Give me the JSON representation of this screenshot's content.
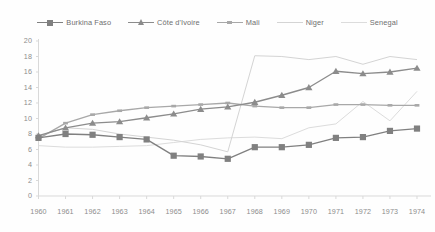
{
  "chart_data": {
    "type": "line",
    "title": "",
    "xlabel": "",
    "ylabel": "",
    "grid": false,
    "legend_position": "top",
    "ylim": [
      0,
      20
    ],
    "ytick_labels": [
      "20",
      "18",
      "16",
      "14",
      "12",
      "10",
      "8",
      "6",
      "4",
      "2",
      "0"
    ],
    "yticks": [
      20,
      18,
      16,
      14,
      12,
      10,
      8,
      6,
      4,
      2,
      0
    ],
    "categories": [
      "1960",
      "1961",
      "1962",
      "1963",
      "1964",
      "1965",
      "1966",
      "1967",
      "1968",
      "1969",
      "1970",
      "1971",
      "1972",
      "1973",
      "1974"
    ],
    "x": [
      1960,
      1961,
      1962,
      1963,
      1964,
      1965,
      1966,
      1967,
      1968,
      1969,
      1970,
      1971,
      1972,
      1973,
      1974
    ],
    "series": [
      {
        "name": "Burkina Faso",
        "color": "#808080",
        "marker": "square",
        "values": [
          7.5,
          8.0,
          7.9,
          7.6,
          7.3,
          5.2,
          5.1,
          4.8,
          6.3,
          6.3,
          6.6,
          7.5,
          7.6,
          8.4,
          8.7
        ]
      },
      {
        "name": "Côte d'Ivoire",
        "color": "#8c8c8c",
        "marker": "triangle",
        "values": [
          7.8,
          8.8,
          9.4,
          9.6,
          10.1,
          10.6,
          11.2,
          11.5,
          12.1,
          13.0,
          14.0,
          16.1,
          15.8,
          16.0,
          16.5
        ]
      },
      {
        "name": "Mali",
        "color": "#a8a8a8",
        "marker": "tick",
        "values": [
          7.4,
          9.4,
          10.5,
          11.0,
          11.4,
          11.6,
          11.8,
          12.0,
          11.6,
          11.4,
          11.4,
          11.8,
          11.8,
          11.7,
          11.7
        ]
      },
      {
        "name": "Niger",
        "color": "#d4d4d4",
        "marker": "none",
        "values": [
          7.7,
          8.8,
          8.6,
          8.0,
          7.6,
          7.2,
          6.6,
          5.7,
          18.1,
          18.0,
          17.6,
          18.0,
          17.0,
          18.0,
          17.6
        ]
      },
      {
        "name": "Senegal",
        "color": "#dcdcdc",
        "marker": "none",
        "values": [
          6.5,
          6.3,
          6.3,
          6.4,
          6.5,
          6.9,
          7.3,
          7.5,
          7.6,
          7.4,
          8.8,
          9.3,
          12.2,
          9.7,
          13.5
        ]
      }
    ]
  },
  "legend": {
    "items": [
      {
        "label": "Burkina Faso"
      },
      {
        "label": "Côte d'Ivoire"
      },
      {
        "label": "Mali"
      },
      {
        "label": "Niger"
      },
      {
        "label": "Senegal"
      }
    ]
  },
  "colors": {
    "axis": "#d9d9d9",
    "tick_text": "#8d8d8d",
    "legend_text": "#6f6f6f",
    "background": "#fefefe"
  }
}
